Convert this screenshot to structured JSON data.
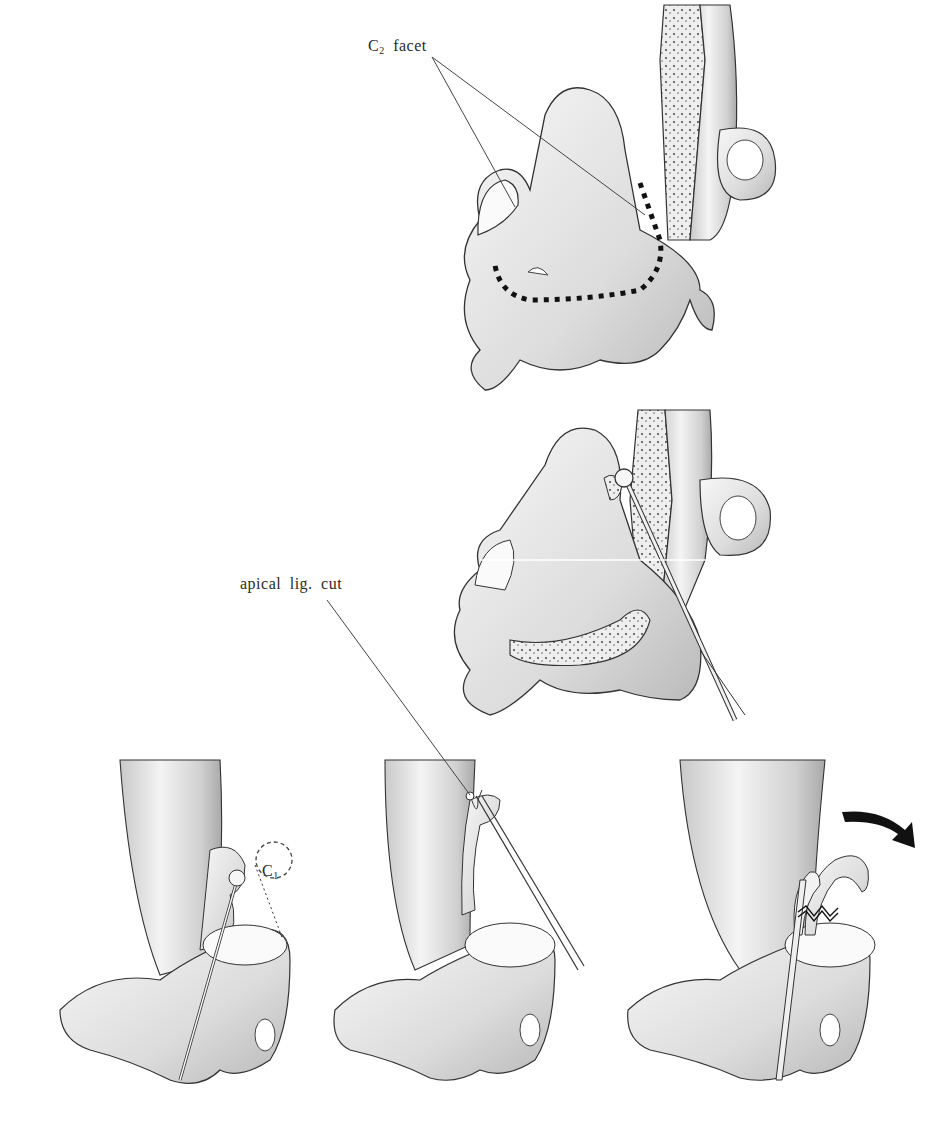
{
  "figure": {
    "panels": [
      {
        "id": "top",
        "content": "C2 vertebra with dens; dotted resection line along base"
      },
      {
        "id": "middle",
        "content": "C2 vertebra sectioned; probe/dissector at apex of dens"
      },
      {
        "id": "bottom-left",
        "content": "Lateral view with probe; dashed C1 circle outline"
      },
      {
        "id": "bottom-center",
        "content": "Lateral view; instrument cutting apical ligament"
      },
      {
        "id": "bottom-right",
        "content": "Lateral view; dens rotated out, curved arrow indicating direction"
      }
    ]
  },
  "labels": {
    "c2_facet": {
      "main": "C",
      "sub": "2",
      "rest": " facet"
    },
    "apical_lig_cut": "apical lig. cut",
    "c1": {
      "main": "C",
      "sub": "1"
    }
  },
  "colors": {
    "background": "#ffffff",
    "bone_fill": "#ececec",
    "bone_shadow": "#bdbdbd",
    "outline": "#3a3a3a",
    "dotted_line": "#111111",
    "arrow": "#111111"
  }
}
